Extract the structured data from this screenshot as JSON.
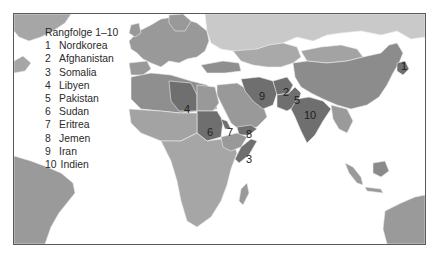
{
  "legend": {
    "title": "Rangfolge 1–10",
    "items": [
      {
        "rank": "1",
        "country": "Nordkorea"
      },
      {
        "rank": "2",
        "country": "Afghanistan"
      },
      {
        "rank": "3",
        "country": "Somalia"
      },
      {
        "rank": "4",
        "country": "Libyen"
      },
      {
        "rank": "5",
        "country": "Pakistan"
      },
      {
        "rank": "6",
        "country": "Sudan"
      },
      {
        "rank": "7",
        "country": "Eritrea"
      },
      {
        "rank": "8",
        "country": "Jemen"
      },
      {
        "rank": "9",
        "country": "Iran"
      },
      {
        "rank": "10",
        "country": "Indien"
      }
    ]
  },
  "map_labels": [
    {
      "rank": "1",
      "x": 400,
      "y": 66
    },
    {
      "rank": "2",
      "x": 282,
      "y": 92
    },
    {
      "rank": "3",
      "x": 245,
      "y": 158
    },
    {
      "rank": "4",
      "x": 183,
      "y": 108
    },
    {
      "rank": "5",
      "x": 293,
      "y": 100
    },
    {
      "rank": "6",
      "x": 206,
      "y": 131
    },
    {
      "rank": "7",
      "x": 226,
      "y": 131
    },
    {
      "rank": "8",
      "x": 245,
      "y": 133
    },
    {
      "rank": "9",
      "x": 258,
      "y": 95
    },
    {
      "rank": "10",
      "x": 304,
      "y": 114
    }
  ],
  "colors": {
    "ocean": "#ffffff",
    "rank_top": "#6f6f6f",
    "high": "#8c8c8c",
    "medium": "#a3a3a3",
    "low": "#c9c9c9",
    "border": "#e8e8e8",
    "frame": "#5a5a5a"
  }
}
